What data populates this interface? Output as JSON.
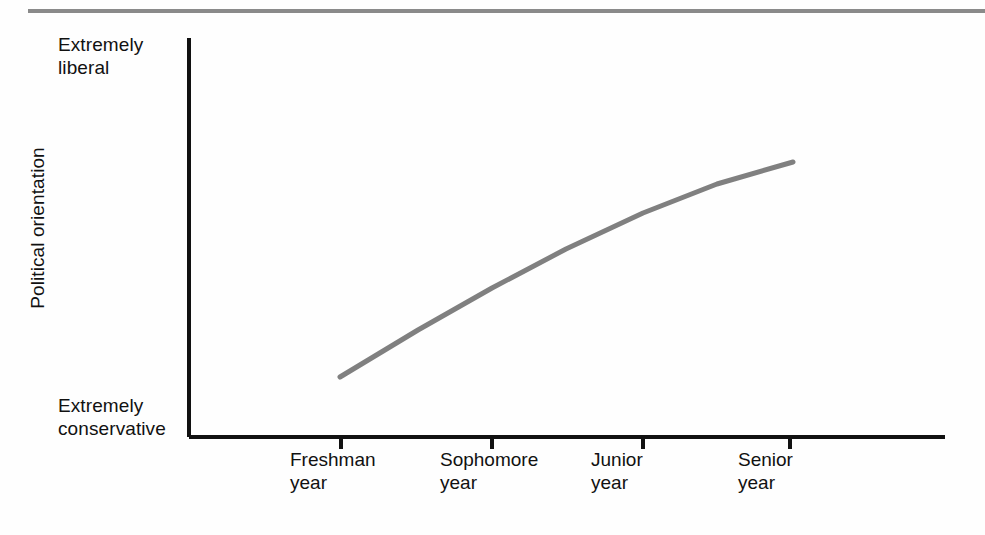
{
  "chart_data": {
    "type": "line",
    "title": "",
    "subtitle": "",
    "xlabel": "",
    "ylabel": "Political orientation",
    "categories": [
      "Freshman year",
      "Sophomore year",
      "Junior year",
      "Senior year"
    ],
    "category_lines": [
      [
        "Freshman",
        "year"
      ],
      [
        "Sophomore",
        "year"
      ],
      [
        "Junior",
        "year"
      ],
      [
        "Senior",
        "year"
      ]
    ],
    "series": [
      {
        "name": "Political orientation over college years",
        "values": [
          0.23,
          0.56,
          0.84,
          1.0
        ],
        "color": "#808080"
      }
    ],
    "y_axis": {
      "min_label": "Extremely conservative",
      "max_label": "Extremely liberal",
      "min_label_lines": [
        "Extremely",
        "conservative"
      ],
      "max_label_lines": [
        "Extremely",
        "liberal"
      ],
      "ylim": [
        0,
        1
      ],
      "ticks_visible": false
    },
    "x_axis": {
      "ticks_visible": true,
      "tick_count": 4
    },
    "grid": false,
    "legend": false,
    "legend_position": "none",
    "annotation": "Curve rises steeply from freshman year then flattens toward senior year, showing increasing liberal orientation across college years.",
    "geometry": {
      "axis_color": "#111111",
      "line_color": "#808080",
      "line_width": 5,
      "top_rule_color": "#8a8a8a",
      "plot_left": 189,
      "plot_bottom": 437,
      "plot_right": 945,
      "plot_top": 38,
      "tick_x": [
        341,
        492,
        643,
        790
      ],
      "tick_length": 12,
      "points": [
        {
          "x": 340,
          "y": 377
        },
        {
          "x": 418,
          "y": 330
        },
        {
          "x": 492,
          "y": 288
        },
        {
          "x": 566,
          "y": 249
        },
        {
          "x": 643,
          "y": 213
        },
        {
          "x": 717,
          "y": 184
        },
        {
          "x": 793,
          "y": 162
        }
      ],
      "label_x": [
        290,
        440,
        591,
        738
      ]
    }
  }
}
